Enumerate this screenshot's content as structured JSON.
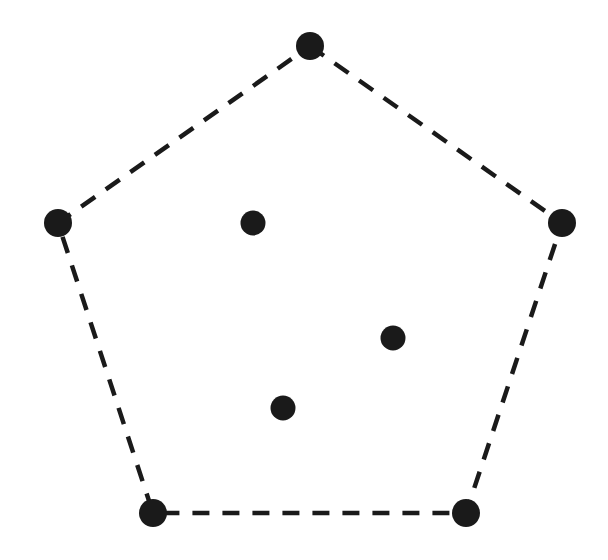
{
  "figure": {
    "name": "convex-hull-point-set",
    "width": 608,
    "height": 560,
    "background_color": "#ffffff",
    "ink_color": "#1a1a1a"
  },
  "chart_data": {
    "type": "scatter",
    "title": "",
    "subtitle": "",
    "xlabel": "",
    "ylabel": "",
    "xlim": [
      0,
      608
    ],
    "ylim": [
      0,
      560
    ],
    "grid": false,
    "legend": false,
    "legend_position": "none",
    "axes_visible": false,
    "tick_labels_x": [],
    "tick_labels_y": [],
    "annotations": [],
    "series": [
      {
        "name": "hull-vertices",
        "marker": "filled-circle",
        "marker_radius": 14,
        "color": "#1a1a1a",
        "points": [
          {
            "label": "top-vertex",
            "x": 310,
            "y": 46
          },
          {
            "label": "right-vertex",
            "x": 562,
            "y": 223
          },
          {
            "label": "bottom-right-vertex",
            "x": 466,
            "y": 513
          },
          {
            "label": "bottom-left-vertex",
            "x": 153,
            "y": 513
          },
          {
            "label": "left-vertex",
            "x": 58,
            "y": 223
          }
        ]
      },
      {
        "name": "interior-points",
        "marker": "filled-circle",
        "marker_radius": 12.5,
        "color": "#1a1a1a",
        "points": [
          {
            "label": "interior-upper-left",
            "x": 253,
            "y": 223
          },
          {
            "label": "interior-middle-right",
            "x": 393,
            "y": 338
          },
          {
            "label": "interior-lower-center",
            "x": 283,
            "y": 408
          }
        ]
      }
    ],
    "hull_polygon": {
      "name": "convex-hull-boundary",
      "closed": true,
      "stroke_color": "#1a1a1a",
      "stroke_width": 4.5,
      "dash_on": 17,
      "dash_off": 13,
      "vertex_order": [
        "top-vertex",
        "right-vertex",
        "bottom-right-vertex",
        "bottom-left-vertex",
        "left-vertex"
      ],
      "points_attr": "310,46 562,223 466,513 153,513 58,223"
    }
  }
}
